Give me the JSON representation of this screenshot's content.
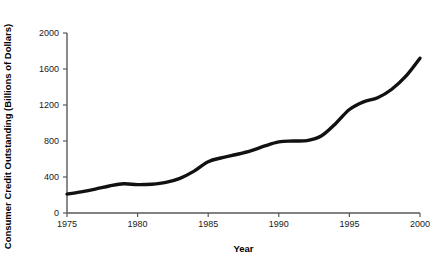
{
  "chart_data": {
    "type": "line",
    "title": "",
    "xlabel": "Year",
    "ylabel": "Consumer Credit Outstanding (Billions of Dollars)",
    "xlim": [
      1975,
      2000
    ],
    "ylim": [
      0,
      2000
    ],
    "xticks": [
      1975,
      1980,
      1985,
      1990,
      1995,
      2000
    ],
    "xtick_labels": [
      "1975",
      "1980",
      "1985",
      "1990",
      "1995",
      "2000"
    ],
    "yticks": [
      0,
      400,
      800,
      1200,
      1600,
      2000
    ],
    "ytick_labels": [
      "0",
      "400",
      "800",
      "1200",
      "1600",
      "2000"
    ],
    "grid": false,
    "legend": false,
    "line_color": "#111111",
    "line_width": 3.4,
    "axis_color": "#595959",
    "series": [
      {
        "name": "Consumer Credit Outstanding",
        "x": [
          1975,
          1976,
          1977,
          1978,
          1979,
          1980,
          1981,
          1982,
          1983,
          1984,
          1985,
          1986,
          1987,
          1988,
          1989,
          1990,
          1991,
          1992,
          1993,
          1994,
          1995,
          1996,
          1997,
          1998,
          1999,
          2000
        ],
        "values": [
          210,
          235,
          265,
          300,
          325,
          315,
          320,
          340,
          385,
          465,
          570,
          615,
          650,
          690,
          745,
          790,
          800,
          805,
          855,
          990,
          1150,
          1235,
          1280,
          1375,
          1520,
          1720
        ]
      }
    ]
  }
}
